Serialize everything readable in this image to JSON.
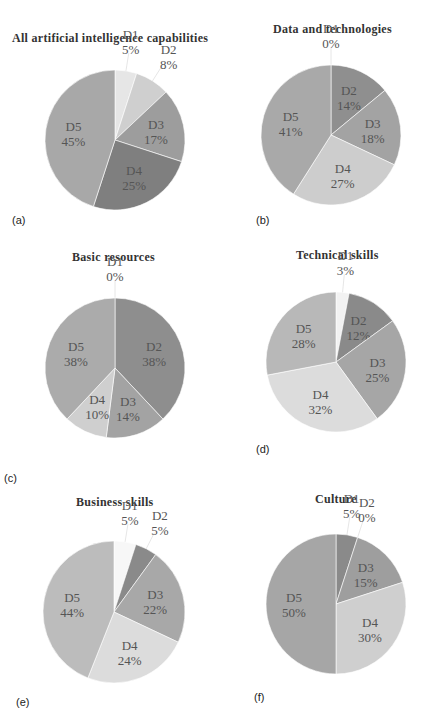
{
  "figure": {
    "panels": [
      {
        "id": "a",
        "tag": "(a)",
        "title": "All artificial intelligence capabilities"
      },
      {
        "id": "b",
        "tag": "(b)",
        "title": "Data and technologies"
      },
      {
        "id": "c",
        "tag": "(c)",
        "title": "Basic resources"
      },
      {
        "id": "d",
        "tag": "(d)",
        "title": "Technical skills"
      },
      {
        "id": "e",
        "tag": "(e)",
        "title": "Business skills"
      },
      {
        "id": "f",
        "tag": "(f)",
        "title": "Culture"
      }
    ]
  },
  "colors": {
    "D1": "#ececec",
    "D2_default": "#c4c4c4",
    "D3": "#9c9c9c",
    "D4": "#888888",
    "D5": "#a9a9a9"
  },
  "chart_data": [
    {
      "type": "pie",
      "title": "All artificial intelligence capabilities",
      "panel": "(a)",
      "categories": [
        "D1",
        "D2",
        "D3",
        "D4",
        "D5"
      ],
      "values": [
        5,
        8,
        17,
        25,
        45
      ],
      "labels": [
        "D1 5%",
        "D2 8%",
        "D3 17%",
        "D4 25%",
        "D5 45%"
      ],
      "colors": [
        "#e6e6e6",
        "#cfcfcf",
        "#9d9d9d",
        "#7f7f7f",
        "#a8a8a8"
      ]
    },
    {
      "type": "pie",
      "title": "Data and technologies",
      "panel": "(b)",
      "categories": [
        "D1",
        "D2",
        "D3",
        "D4",
        "D5"
      ],
      "values": [
        0,
        14,
        18,
        27,
        41
      ],
      "labels": [
        "D1 0%",
        "D2 14%",
        "D3 18%",
        "D4 27%",
        "D5 41%"
      ],
      "colors": [
        "#e6e6e6",
        "#8f8f8f",
        "#a3a3a3",
        "#cdcdcd",
        "#a9a9a9"
      ]
    },
    {
      "type": "pie",
      "title": "Basic resources",
      "panel": "(c)",
      "categories": [
        "D1",
        "D2",
        "D3",
        "D4",
        "D5"
      ],
      "values": [
        0,
        38,
        14,
        10,
        38
      ],
      "labels": [
        "D1 0%",
        "D2 38%",
        "D3 14%",
        "D4 10%",
        "D5 38%"
      ],
      "colors": [
        "#e6e6e6",
        "#8e8e8e",
        "#a3a3a3",
        "#cfcfcf",
        "#ababab"
      ]
    },
    {
      "type": "pie",
      "title": "Technical skills",
      "panel": "(d)",
      "categories": [
        "D1",
        "D2",
        "D3",
        "D4",
        "D5"
      ],
      "values": [
        3,
        12,
        25,
        32,
        28
      ],
      "labels": [
        "D1 3%",
        "D2 12%",
        "D3 25%",
        "D4 32%",
        "D5 28%"
      ],
      "colors": [
        "#f2f2f2",
        "#8a8a8a",
        "#a6a6a6",
        "#dcdcdc",
        "#b8b8b8"
      ]
    },
    {
      "type": "pie",
      "title": "Business skills",
      "panel": "(e)",
      "categories": [
        "D1",
        "D2",
        "D3",
        "D4",
        "D5"
      ],
      "values": [
        5,
        5,
        22,
        24,
        44
      ],
      "labels": [
        "D1 5%",
        "D2 5%",
        "D3 22%",
        "D4 24%",
        "D5 44%"
      ],
      "colors": [
        "#f7f7f7",
        "#8a8a8a",
        "#a8a8a8",
        "#dcdcdc",
        "#bcbcbc"
      ]
    },
    {
      "type": "pie",
      "title": "Culture",
      "panel": "(f)",
      "categories": [
        "D1",
        "D2",
        "D3",
        "D4",
        "D5"
      ],
      "values": [
        5,
        0,
        15,
        30,
        50
      ],
      "labels": [
        "D1 5%",
        "D2 0%",
        "D3 15%",
        "D4 30%",
        "D5 50%"
      ],
      "colors": [
        "#8a8a8a",
        "#e6e6e6",
        "#9e9e9e",
        "#cfcfcf",
        "#a6a6a6"
      ]
    }
  ]
}
